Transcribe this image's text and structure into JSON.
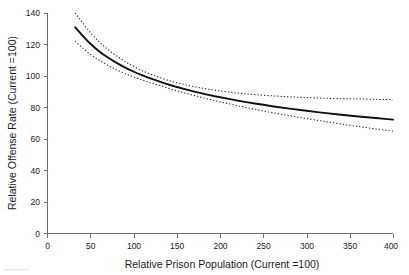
{
  "figure": {
    "background_color": "#ffffff",
    "axis_color": "#6e6e6e",
    "curve_color": "#101010",
    "ci_color": "#242424"
  },
  "chart_data": {
    "type": "line",
    "title": "",
    "subtitle": "",
    "xlabel": "Relative Prison Population (Current =100)",
    "ylabel": "Relative Offense Rate (Current =100)",
    "xlim": [
      0,
      400
    ],
    "ylim": [
      0,
      140
    ],
    "xticks": [
      0,
      50,
      100,
      150,
      200,
      250,
      300,
      350,
      400
    ],
    "yticks": [
      0,
      20,
      40,
      60,
      80,
      100,
      120,
      140
    ],
    "xtick_labels": [
      "0",
      "50",
      "100",
      "150",
      "200",
      "250",
      "300",
      "350",
      "400"
    ],
    "ytick_labels": [
      "0",
      "20",
      "40",
      "60",
      "80",
      "100",
      "120",
      "140"
    ],
    "grid": false,
    "legend": null,
    "legend_position": "none",
    "annotations": [],
    "x": [
      32,
      40,
      50,
      60,
      70,
      80,
      90,
      100,
      110,
      120,
      130,
      140,
      150,
      160,
      170,
      180,
      190,
      200,
      220,
      240,
      260,
      280,
      300,
      320,
      340,
      360,
      380,
      400
    ],
    "series": [
      {
        "name": "Estimated relative offense rate",
        "style": "solid",
        "values": [
          131.0,
          126.0,
          120.3,
          115.6,
          111.7,
          108.3,
          105.3,
          102.7,
          100.4,
          98.3,
          96.4,
          94.6,
          93.0,
          91.5,
          90.1,
          88.8,
          87.6,
          86.5,
          84.4,
          82.5,
          80.8,
          79.3,
          77.9,
          76.6,
          75.4,
          74.3,
          73.3,
          72.3
        ]
      },
      {
        "name": "Upper confidence bound",
        "style": "dotted",
        "values": [
          140.0,
          134.2,
          127.3,
          121.6,
          116.8,
          112.7,
          109.1,
          106.0,
          103.3,
          101.0,
          99.0,
          97.2,
          95.7,
          94.4,
          93.2,
          92.2,
          91.3,
          90.5,
          89.2,
          88.2,
          87.4,
          86.8,
          86.3,
          85.9,
          85.6,
          85.4,
          85.2,
          85.0
        ]
      },
      {
        "name": "Lower confidence bound",
        "style": "dotted",
        "values": [
          122.0,
          118.1,
          113.6,
          109.9,
          106.7,
          103.9,
          101.5,
          99.3,
          97.4,
          95.6,
          93.9,
          92.2,
          90.6,
          89.1,
          87.6,
          86.2,
          84.9,
          83.6,
          81.2,
          78.9,
          76.8,
          74.8,
          73.0,
          71.2,
          69.5,
          67.9,
          66.4,
          65.0
        ]
      }
    ],
    "reference_point": {
      "x": 100,
      "y": 100,
      "note": "Current = 100 on both axes"
    }
  }
}
